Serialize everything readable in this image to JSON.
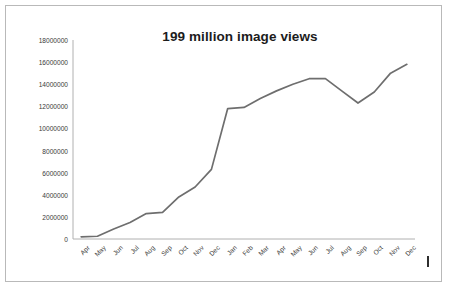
{
  "chart_data": {
    "type": "line",
    "title": "199 million image views",
    "xlabel": "",
    "ylabel": "",
    "grid": false,
    "legend": false,
    "ylim": [
      0,
      18000000
    ],
    "ytick_values": [
      "18000000",
      "16000000",
      "14000000",
      "12000000",
      "10000000",
      "8000000",
      "6000000",
      "4000000",
      "2000000",
      "0"
    ],
    "categories": [
      "Apr",
      "May",
      "Jun",
      "Jul",
      "Aug",
      "Sep",
      "Oct",
      "Nov",
      "Dec",
      "Jan",
      "Feb",
      "Mar",
      "Apr",
      "May",
      "Jun",
      "Jul",
      "Aug",
      "Sep",
      "Oct",
      "Nov",
      "Dec"
    ],
    "values": [
      200000,
      250000,
      900000,
      1500000,
      2300000,
      2400000,
      3800000,
      4700000,
      6300000,
      11800000,
      11900000,
      12700000,
      13400000,
      14000000,
      14500000,
      14500000,
      13400000,
      12300000,
      13300000,
      15000000,
      15800000
    ],
    "line_color": "#6e6e6e",
    "axis_color": "#b0b0b0"
  },
  "annotations": {
    "corner_mark": "vertical-tick-mark"
  }
}
